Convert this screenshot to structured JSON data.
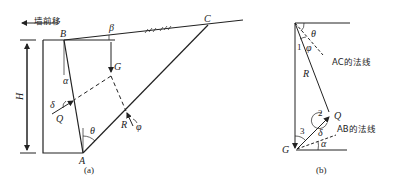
{
  "figure_a": {
    "caption": "(a)",
    "wall_move_label": "墙前移",
    "points": {
      "A": "A",
      "B": "B",
      "C": "C",
      "G": "G",
      "Q": "Q",
      "R": "R"
    },
    "angles": {
      "alpha": "α",
      "beta": "β",
      "theta": "θ",
      "delta": "δ",
      "phi": "φ"
    },
    "height_label": "H"
  },
  "figure_b": {
    "caption": "(b)",
    "points": {
      "G": "G",
      "Q": "Q",
      "R": "R"
    },
    "angles": {
      "theta": "θ",
      "phi": "φ",
      "delta": "δ",
      "alpha": "α"
    },
    "vertex_numbers": [
      "1",
      "2",
      "3"
    ],
    "ac_normal_label": "AC的法线",
    "ab_normal_label": "AB的法线"
  },
  "colors": {
    "line": "#222222",
    "background": "#ffffff"
  }
}
